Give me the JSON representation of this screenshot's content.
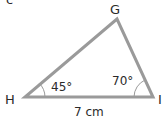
{
  "figure": {
    "part_label": "c",
    "vertices": {
      "G": {
        "label": "G",
        "x": 117,
        "y": 19
      },
      "H": {
        "label": "H",
        "x": 25,
        "y": 97
      },
      "I": {
        "label": "I",
        "x": 153,
        "y": 97
      }
    },
    "angles": {
      "H": {
        "label": "45°"
      },
      "I": {
        "label": "70°"
      }
    },
    "sides": {
      "HI": {
        "label": "7 cm"
      }
    },
    "colors": {
      "stroke": "#9a9a9a",
      "text": "#2a2a2a"
    }
  }
}
